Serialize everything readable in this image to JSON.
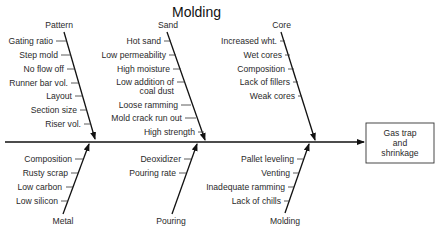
{
  "title": "Molding",
  "effect": {
    "lines": [
      "Gas trap",
      "and",
      "shrinkage"
    ]
  },
  "categories": {
    "pattern": {
      "label": "Pattern",
      "causes": [
        "Gating ratio",
        "Step mold",
        "No flow off",
        "Runner bar vol.",
        "Layout",
        "Section size",
        "Riser vol."
      ]
    },
    "sand": {
      "label": "Sand",
      "causes": [
        "Hot sand",
        "Low permeability",
        "High moisture",
        "Low addition of",
        "coal dust",
        "Loose ramming",
        "Mold crack run out",
        "High strength"
      ]
    },
    "core": {
      "label": "Core",
      "causes": [
        "Increased wht.",
        "Wet cores",
        "Composition",
        "Lack of fillers",
        "Weak cores"
      ]
    },
    "metal": {
      "label": "Metal",
      "causes": [
        "Composition",
        "Rusty scrap",
        "Low carbon",
        "Low silicon"
      ]
    },
    "pouring": {
      "label": "Pouring",
      "causes": [
        "Deoxidizer",
        "Pouring rate"
      ]
    },
    "molding": {
      "label": "Molding",
      "causes": [
        "Pallet leveling",
        "Venting",
        "Inadequate ramming",
        "Lack of chills"
      ]
    }
  }
}
